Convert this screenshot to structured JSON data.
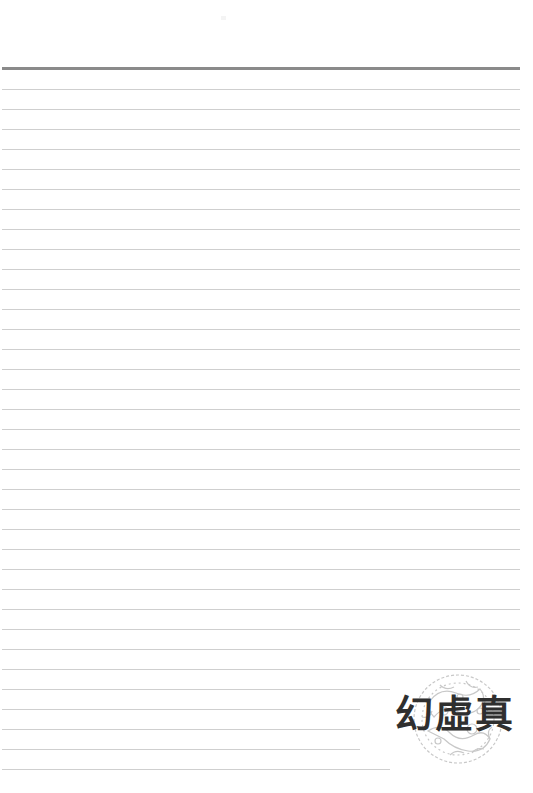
{
  "page": {
    "type": "lined-notebook-page",
    "background_color": "#ffffff",
    "header_rule_color": "#8a8a8a",
    "rule_color": "#cfcfcf",
    "rule_spacing_px": 20,
    "rule_count": 35
  },
  "logo": {
    "text": "幻虛真",
    "text_color": "#2f2f2f",
    "ornament": "circular-dragon-cloud-motif",
    "ornament_color": "#c8c8c8"
  }
}
